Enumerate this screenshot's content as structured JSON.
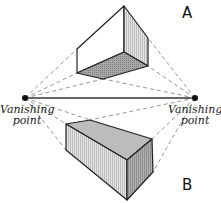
{
  "diagram": {
    "labels": {
      "box_above": "A",
      "box_below": "B",
      "left_vp_line1": "Vanishing",
      "left_vp_line2": "point",
      "right_vp_line1": "Vanishing",
      "right_vp_line2": "point"
    },
    "vanishing_points": [
      {
        "name": "left",
        "x": 25,
        "y": 98
      },
      {
        "name": "right",
        "x": 195,
        "y": 98
      }
    ],
    "colors": {
      "stroke": "#222222",
      "dashed": "#888888",
      "shade_light": "#d8d8d8",
      "shade_mid": "#b5b5b5",
      "shade_dark": "#9a9a9a",
      "face_white": "#ffffff"
    }
  }
}
